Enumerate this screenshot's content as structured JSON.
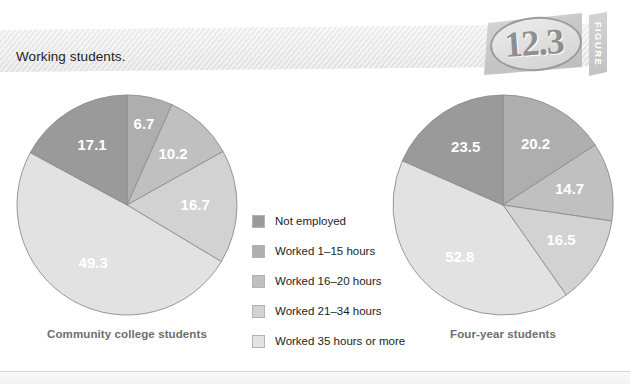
{
  "header": {
    "title": "Working students.",
    "figure_number": "12.3",
    "figure_word": "FIGURE"
  },
  "legend": {
    "items": [
      {
        "label": "Not employed",
        "color": "#9a9a9a"
      },
      {
        "label": "Worked 1–15 hours",
        "color": "#aeaeae"
      },
      {
        "label": "Worked 16–20 hours",
        "color": "#c0c0c0"
      },
      {
        "label": "Worked 21–34 hours",
        "color": "#d2d2d2"
      },
      {
        "label": "Worked 35 hours or more",
        "color": "#e2e2e2"
      }
    ]
  },
  "chart_data": [
    {
      "type": "pie",
      "title": "Community college students",
      "categories": [
        "Not employed",
        "Worked 1–15 hours",
        "Worked 16–20 hours",
        "Worked 21–34 hours",
        "Worked 35 hours or more"
      ],
      "values": [
        17.1,
        6.7,
        10.2,
        16.7,
        49.3
      ],
      "labels": [
        "17.1",
        "6.7",
        "10.2",
        "16.7",
        "49.3"
      ],
      "colors": [
        "#9a9a9a",
        "#aeaeae",
        "#c0c0c0",
        "#d2d2d2",
        "#e2e2e2"
      ],
      "legend_position": "center"
    },
    {
      "type": "pie",
      "title": "Four-year students",
      "categories": [
        "Not employed",
        "Worked 1–15 hours",
        "Worked 16–20 hours",
        "Worked 21–34 hours",
        "Worked 35 hours or more"
      ],
      "values": [
        23.5,
        20.2,
        14.7,
        16.5,
        52.8
      ],
      "labels": [
        "23.5",
        "20.2",
        "14.7",
        "16.5",
        "52.8"
      ],
      "colors": [
        "#9a9a9a",
        "#aeaeae",
        "#c0c0c0",
        "#d2d2d2",
        "#e2e2e2"
      ],
      "legend_position": "center"
    }
  ]
}
